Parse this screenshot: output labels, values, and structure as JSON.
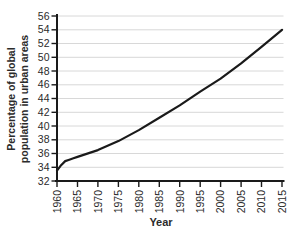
{
  "chart_data": {
    "type": "line",
    "title": "",
    "xlabel": "Year",
    "ylabel": "Percentage of global population in urban areas",
    "ylabel_lines": [
      "Percentage of global",
      "population in urban areas"
    ],
    "xlim": [
      1960,
      2015
    ],
    "ylim": [
      32,
      56
    ],
    "x_ticks": [
      1960,
      1965,
      1970,
      1975,
      1980,
      1985,
      1990,
      1995,
      2000,
      2005,
      2010,
      2015
    ],
    "y_ticks": [
      32,
      34,
      36,
      38,
      40,
      42,
      44,
      46,
      48,
      50,
      52,
      54,
      56
    ],
    "grid": "horizontal",
    "legend": "none",
    "line_color": "#1a1a1a",
    "axis_color": "#1a1a1a",
    "grid_color": "#d8d8d8",
    "text_color": "#2b2b2b",
    "series": [
      {
        "name": "Percentage of global population in urban areas",
        "x": [
          1960,
          1961,
          1962,
          1963,
          1964,
          1965,
          1970,
          1975,
          1980,
          1985,
          1990,
          1995,
          2000,
          2005,
          2010,
          2015
        ],
        "y": [
          33.5,
          34.3,
          34.9,
          35.1,
          35.3,
          35.5,
          36.5,
          37.8,
          39.4,
          41.2,
          43.0,
          45.0,
          46.9,
          49.1,
          51.5,
          54.0
        ]
      }
    ]
  }
}
